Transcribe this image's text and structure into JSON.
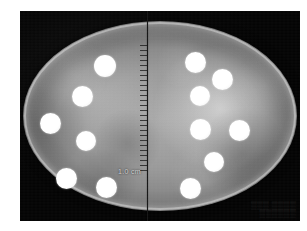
{
  "image": {
    "kind": "specimen-radiograph",
    "width": 307,
    "height": 231,
    "page_background": "#ffffff",
    "plate_background": "#050505"
  },
  "specimen": {
    "label": "oval-specimen",
    "tissue_tone": "#9a9a9a",
    "rim_tone": "#ffffff"
  },
  "midline": {
    "label": "vertical-ruler-divider",
    "color": "#141414",
    "left_x": 147,
    "top_y": 11,
    "bottom_y": 221,
    "ticks_label": "ruler-tick-marks",
    "ticks_top_y": 45,
    "ticks_bottom_y": 175
  },
  "annotations": {
    "scale_label": "1.0 cm",
    "scale_x": 118,
    "scale_y": 168,
    "corner_imprint_line1": "▒▒▒ ▒▒▒▒",
    "corner_imprint_line2": "▒▒▒▒▒▒"
  },
  "markers": {
    "disc_color": "#ffffff",
    "left_half_count": 6,
    "right_half_count": 6,
    "total_count": 12,
    "left_discs": [
      {
        "name": "disc-left-1",
        "x": 94,
        "y": 55,
        "d": 22
      },
      {
        "name": "disc-left-2",
        "x": 72,
        "y": 86,
        "d": 21
      },
      {
        "name": "disc-left-3",
        "x": 40,
        "y": 113,
        "d": 21
      },
      {
        "name": "disc-left-4",
        "x": 76,
        "y": 131,
        "d": 20
      },
      {
        "name": "disc-left-5",
        "x": 56,
        "y": 168,
        "d": 21
      },
      {
        "name": "disc-left-6",
        "x": 96,
        "y": 177,
        "d": 21
      }
    ],
    "right_discs": [
      {
        "name": "disc-right-1",
        "x": 185,
        "y": 52,
        "d": 21
      },
      {
        "name": "disc-right-2",
        "x": 212,
        "y": 69,
        "d": 21
      },
      {
        "name": "disc-right-3",
        "x": 190,
        "y": 86,
        "d": 20
      },
      {
        "name": "disc-right-4",
        "x": 190,
        "y": 119,
        "d": 21
      },
      {
        "name": "disc-right-5",
        "x": 229,
        "y": 120,
        "d": 21
      },
      {
        "name": "disc-right-6",
        "x": 204,
        "y": 152,
        "d": 20
      },
      {
        "name": "disc-right-7",
        "x": 180,
        "y": 178,
        "d": 21
      }
    ]
  }
}
